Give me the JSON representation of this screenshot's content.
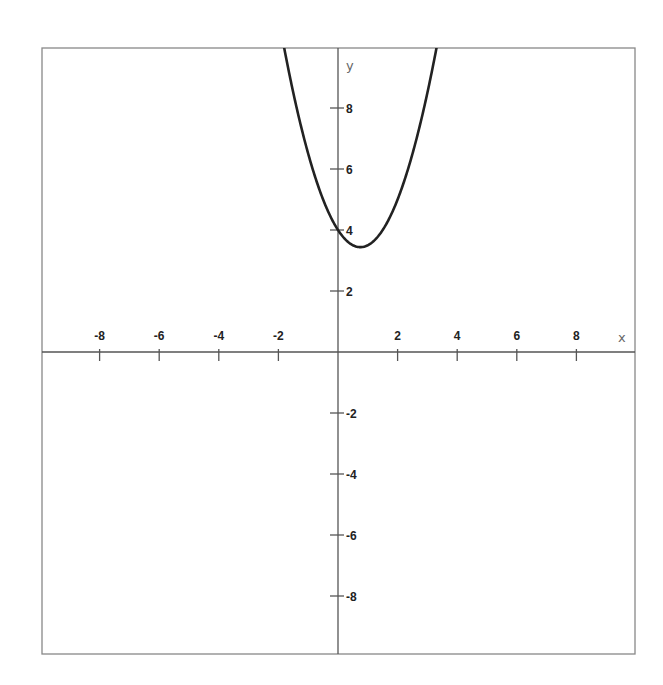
{
  "chart_data": {
    "type": "line",
    "title": "",
    "xlabel": "x",
    "ylabel": "y",
    "xlim": [
      -10,
      10
    ],
    "ylim": [
      -10,
      10
    ],
    "grid": false,
    "legend": null,
    "x_ticks": [
      -8,
      -6,
      -4,
      -2,
      2,
      4,
      6,
      8
    ],
    "y_ticks": [
      8,
      6,
      4,
      2,
      -2,
      -4,
      -6,
      -8
    ],
    "x_tick_labels": [
      "-8",
      "-6",
      "-4",
      "-2",
      "2",
      "4",
      "6",
      "8"
    ],
    "y_tick_labels": [
      "8",
      "6",
      "4",
      "2",
      "-2",
      "-4",
      "-6",
      "-8"
    ],
    "series": [
      {
        "name": "parabola",
        "description": "upward-opening parabola, approx. y = x^2 - 1.5x + 4",
        "vertex": [
          0.75,
          3.44
        ],
        "y_intercept": 4,
        "x": [
          -1.8,
          -1.5,
          -1.0,
          -0.5,
          0.0,
          0.5,
          0.75,
          1.0,
          1.5,
          2.0,
          2.5,
          3.0,
          3.3
        ],
        "y": [
          10.0,
          8.5,
          6.5,
          5.0,
          4.0,
          3.5,
          3.44,
          3.5,
          4.0,
          5.0,
          6.5,
          8.5,
          9.9
        ],
        "color": "#222222"
      }
    ]
  },
  "plot": {
    "x_axis_name": "x",
    "y_axis_name": "y",
    "colors": {
      "frame": "#888888",
      "axes": "#555555",
      "curve": "#222222",
      "labels": "#222222"
    }
  }
}
